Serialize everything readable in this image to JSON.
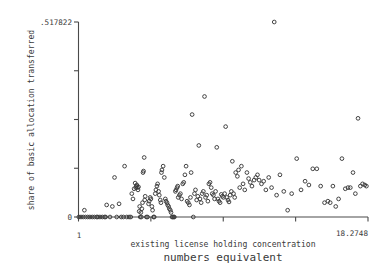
{
  "chart_data": {
    "type": "scatter",
    "title": "",
    "xlabel": "existing license holding concentration",
    "xlabel_line2": "numbers equivalent",
    "ylabel": "share of basic allocation transferred",
    "xlim": [
      1,
      18.2748
    ],
    "ylim": [
      0,
      0.517822
    ],
    "xticklabels": [
      "1",
      "",
      "",
      "",
      "18.2748"
    ],
    "yticklabels": [
      ".517822",
      "",
      "",
      "",
      "0"
    ],
    "xtick_count": 5,
    "ytick_count": 5,
    "grid": false,
    "legend": false,
    "marker": "open-circle",
    "marker_color": "#3a3a3a",
    "axis_color": "#4a4a4a",
    "background": "#ffffff",
    "n_points": 186,
    "points": [
      [
        1.02,
        0.0
      ],
      [
        1.15,
        0.0
      ],
      [
        1.28,
        0.0
      ],
      [
        1.35,
        0.018
      ],
      [
        1.42,
        0.0
      ],
      [
        1.55,
        0.0
      ],
      [
        1.68,
        0.0
      ],
      [
        1.82,
        0.0
      ],
      [
        1.95,
        0.0
      ],
      [
        2.08,
        0.0
      ],
      [
        2.15,
        0.0
      ],
      [
        2.28,
        0.0
      ],
      [
        2.42,
        0.0
      ],
      [
        2.55,
        0.0
      ],
      [
        2.68,
        0.032
      ],
      [
        2.62,
        0.0
      ],
      [
        2.88,
        0.0
      ],
      [
        3.02,
        0.028
      ],
      [
        3.15,
        0.105
      ],
      [
        3.28,
        0.0
      ],
      [
        3.42,
        0.035
      ],
      [
        3.55,
        0.0
      ],
      [
        3.68,
        0.0
      ],
      [
        3.75,
        0.135
      ],
      [
        3.88,
        0.0
      ],
      [
        4.02,
        0.0
      ],
      [
        4.12,
        0.0
      ],
      [
        4.18,
        0.062
      ],
      [
        4.25,
        0.048
      ],
      [
        4.32,
        0.075
      ],
      [
        4.38,
        0.09
      ],
      [
        4.42,
        0.078
      ],
      [
        4.45,
        0.082
      ],
      [
        4.48,
        0.085
      ],
      [
        4.52,
        0.078
      ],
      [
        4.55,
        0.072
      ],
      [
        4.58,
        0.08
      ],
      [
        4.62,
        0.015
      ],
      [
        4.65,
        0.028
      ],
      [
        4.68,
        0.0
      ],
      [
        4.72,
        0.012
      ],
      [
        4.75,
        0.0
      ],
      [
        4.78,
        0.022
      ],
      [
        4.82,
        0.038
      ],
      [
        4.85,
        0.118
      ],
      [
        4.88,
        0.122
      ],
      [
        4.92,
        0.158
      ],
      [
        4.95,
        0.045
      ],
      [
        4.98,
        0.055
      ],
      [
        5.05,
        0.0
      ],
      [
        5.12,
        0.0
      ],
      [
        5.18,
        0.035
      ],
      [
        5.22,
        0.042
      ],
      [
        5.28,
        0.052
      ],
      [
        5.32,
        0.048
      ],
      [
        5.38,
        0.028
      ],
      [
        5.42,
        0.018
      ],
      [
        5.48,
        0.0
      ],
      [
        5.52,
        0.0
      ],
      [
        5.58,
        0.062
      ],
      [
        5.62,
        0.072
      ],
      [
        5.68,
        0.082
      ],
      [
        5.72,
        0.088
      ],
      [
        5.78,
        0.068
      ],
      [
        5.82,
        0.058
      ],
      [
        5.88,
        0.045
      ],
      [
        5.92,
        0.038
      ],
      [
        5.95,
        0.118
      ],
      [
        5.98,
        0.125
      ],
      [
        6.05,
        0.135
      ],
      [
        6.12,
        0.105
      ],
      [
        6.18,
        0.048
      ],
      [
        6.22,
        0.042
      ],
      [
        6.28,
        0.038
      ],
      [
        6.32,
        0.032
      ],
      [
        6.38,
        0.028
      ],
      [
        6.42,
        0.022
      ],
      [
        6.48,
        0.018
      ],
      [
        6.52,
        0.012
      ],
      [
        6.58,
        0.0
      ],
      [
        6.62,
        0.0
      ],
      [
        6.68,
        0.0
      ],
      [
        6.72,
        0.0
      ],
      [
        6.78,
        0.068
      ],
      [
        6.82,
        0.072
      ],
      [
        6.88,
        0.078
      ],
      [
        6.92,
        0.082
      ],
      [
        6.95,
        0.052
      ],
      [
        7.02,
        0.058
      ],
      [
        7.08,
        0.062
      ],
      [
        7.15,
        0.048
      ],
      [
        7.22,
        0.088
      ],
      [
        7.28,
        0.092
      ],
      [
        7.35,
        0.112
      ],
      [
        7.42,
        0.135
      ],
      [
        7.48,
        0.042
      ],
      [
        7.55,
        0.038
      ],
      [
        7.62,
        0.032
      ],
      [
        7.68,
        0.052
      ],
      [
        7.72,
        0.118
      ],
      [
        7.78,
        0.272
      ],
      [
        7.85,
        0.0
      ],
      [
        7.92,
        0.062
      ],
      [
        7.98,
        0.072
      ],
      [
        8.05,
        0.045
      ],
      [
        8.12,
        0.055
      ],
      [
        8.18,
        0.19
      ],
      [
        8.25,
        0.048
      ],
      [
        8.32,
        0.038
      ],
      [
        8.38,
        0.062
      ],
      [
        8.45,
        0.068
      ],
      [
        8.52,
        0.32
      ],
      [
        8.58,
        0.052
      ],
      [
        8.65,
        0.058
      ],
      [
        8.72,
        0.042
      ],
      [
        8.78,
        0.088
      ],
      [
        8.85,
        0.092
      ],
      [
        8.92,
        0.078
      ],
      [
        8.98,
        0.062
      ],
      [
        9.05,
        0.058
      ],
      [
        9.12,
        0.048
      ],
      [
        9.18,
        0.068
      ],
      [
        9.25,
        0.185
      ],
      [
        9.32,
        0.048
      ],
      [
        9.38,
        0.042
      ],
      [
        9.45,
        0.038
      ],
      [
        9.52,
        0.06
      ],
      [
        9.58,
        0.055
      ],
      [
        9.65,
        0.052
      ],
      [
        9.72,
        0.062
      ],
      [
        9.78,
        0.24
      ],
      [
        9.85,
        0.052
      ],
      [
        9.92,
        0.045
      ],
      [
        9.98,
        0.04
      ],
      [
        10.05,
        0.058
      ],
      [
        10.12,
        0.068
      ],
      [
        10.18,
        0.148
      ],
      [
        10.25,
        0.062
      ],
      [
        10.32,
        0.052
      ],
      [
        10.38,
        0.118
      ],
      [
        10.48,
        0.108
      ],
      [
        10.55,
        0.125
      ],
      [
        10.62,
        0.078
      ],
      [
        10.72,
        0.135
      ],
      [
        10.82,
        0.088
      ],
      [
        10.92,
        0.072
      ],
      [
        11.05,
        0.118
      ],
      [
        11.15,
        0.102
      ],
      [
        11.25,
        0.092
      ],
      [
        11.35,
        0.082
      ],
      [
        11.48,
        0.098
      ],
      [
        11.58,
        0.105
      ],
      [
        11.68,
        0.112
      ],
      [
        11.78,
        0.098
      ],
      [
        11.92,
        0.088
      ],
      [
        12.05,
        0.095
      ],
      [
        12.18,
        0.072
      ],
      [
        12.35,
        0.105
      ],
      [
        12.52,
        0.078
      ],
      [
        12.68,
        0.5178
      ],
      [
        12.82,
        0.058
      ],
      [
        13.02,
        0.112
      ],
      [
        13.25,
        0.068
      ],
      [
        13.48,
        0.018
      ],
      [
        13.72,
        0.062
      ],
      [
        14.02,
        0.155
      ],
      [
        14.28,
        0.072
      ],
      [
        14.52,
        0.095
      ],
      [
        14.75,
        0.085
      ],
      [
        14.98,
        0.128
      ],
      [
        15.22,
        0.128
      ],
      [
        15.45,
        0.082
      ],
      [
        15.68,
        0.038
      ],
      [
        15.88,
        0.042
      ],
      [
        16.02,
        0.038
      ],
      [
        16.18,
        0.082
      ],
      [
        16.35,
        0.028
      ],
      [
        16.52,
        0.048
      ],
      [
        16.72,
        0.155
      ],
      [
        16.92,
        0.075
      ],
      [
        17.08,
        0.078
      ],
      [
        17.22,
        0.078
      ],
      [
        17.38,
        0.118
      ],
      [
        17.52,
        0.062
      ],
      [
        17.68,
        0.262
      ],
      [
        17.82,
        0.082
      ],
      [
        17.95,
        0.088
      ],
      [
        18.08,
        0.085
      ],
      [
        18.18,
        0.082
      ]
    ]
  }
}
